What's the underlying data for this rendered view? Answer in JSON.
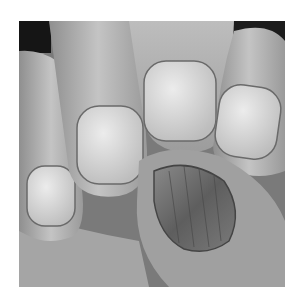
{
  "image": {
    "kind": "photograph",
    "color_mode": "grayscale",
    "subject": "close-up of fingers and fingernails; one thumbnail at lower right appears damaged with dark streaks",
    "border_color": "#ffffff",
    "palette": {
      "shadow": "#1a1a1a",
      "skin_dark": "#7d7d7d",
      "skin_mid": "#a8a8a8",
      "skin_light": "#cfcfcf",
      "nail": "#d9d9d9",
      "nail_damaged": "#6e6e6e"
    }
  }
}
